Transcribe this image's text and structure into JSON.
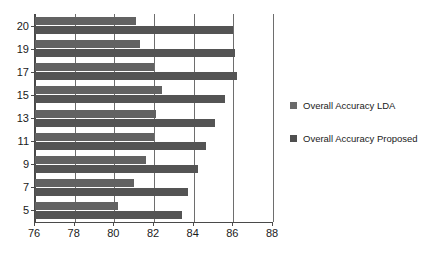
{
  "chart_data": {
    "type": "bar",
    "orientation": "horizontal",
    "title": "",
    "xlabel": "",
    "ylabel": "",
    "xlim": [
      76,
      88
    ],
    "ylim": null,
    "grid": true,
    "grid_axis": "x",
    "legend_position": "right",
    "categories": [
      "20",
      "19",
      "17",
      "15",
      "13",
      "11",
      "9",
      "7",
      "5"
    ],
    "xticks": [
      76,
      78,
      80,
      82,
      84,
      86,
      88
    ],
    "xtick_labels": [
      "76",
      "78",
      "80",
      "82",
      "84",
      "86",
      "88"
    ],
    "series": [
      {
        "name": "Overall Accuracy LDA",
        "color": "#626262",
        "values": [
          81.1,
          81.3,
          82.0,
          82.4,
          82.1,
          82.0,
          81.6,
          81.0,
          80.2
        ]
      },
      {
        "name": "Overall Accuracy Proposed",
        "color": "#545454",
        "values": [
          86.0,
          86.1,
          86.2,
          85.6,
          85.1,
          84.6,
          84.2,
          83.7,
          83.4
        ]
      }
    ]
  },
  "legend": {
    "entries": [
      {
        "label": "Overall Accuracy LDA",
        "swatch_name": "legend-swatch-lda"
      },
      {
        "label": "Overall Accuracy Proposed",
        "swatch_name": "legend-swatch-proposed"
      }
    ]
  }
}
